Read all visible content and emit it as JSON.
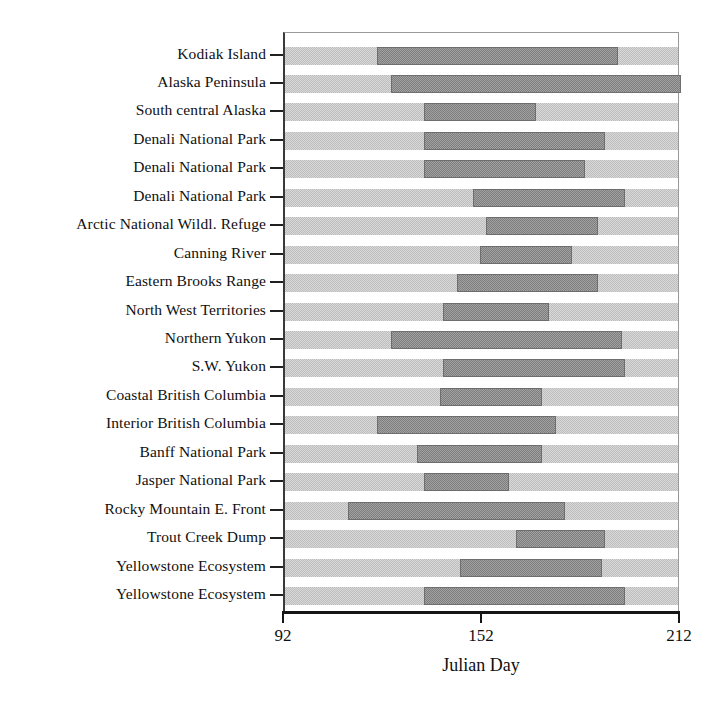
{
  "chart_data": {
    "type": "bar",
    "orientation": "horizontal",
    "subtype": "range-bar",
    "title": "",
    "xlabel": "Julian Day",
    "ylabel": "",
    "xlim": [
      92,
      212
    ],
    "xticks": [
      92,
      152,
      212
    ],
    "xticklabels": [
      "92",
      "152",
      "212"
    ],
    "grid": false,
    "legend": false,
    "band_color": "#d9d9d9",
    "bar_color": "#a2a2a2",
    "bar_edge_color": "#6e6e6e",
    "axis_color": "#151515",
    "categories": [
      "Kodiak Island",
      "Alaska Peninsula",
      "South central Alaska",
      "Denali National Park",
      "Denali National Park",
      "Denali National Park",
      "Arctic National Wildl. Refuge",
      "Canning River",
      "Eastern Brooks Range",
      "North West Territories",
      "Northern Yukon",
      "S.W. Yukon",
      "Coastal British Columbia",
      "Interior British Columbia",
      "Banff National Park",
      "Jasper National Park",
      "Rocky Mountain E. Front",
      "Trout Creek Dump",
      "Yellowstone Ecosystem",
      "Yellowstone Ecosystem"
    ],
    "ranges": [
      [
        120,
        193
      ],
      [
        124,
        212
      ],
      [
        134,
        168
      ],
      [
        134,
        189
      ],
      [
        134,
        183
      ],
      [
        149,
        195
      ],
      [
        153,
        187
      ],
      [
        151,
        179
      ],
      [
        144,
        187
      ],
      [
        140,
        172
      ],
      [
        124,
        194
      ],
      [
        140,
        195
      ],
      [
        139,
        170
      ],
      [
        120,
        174
      ],
      [
        132,
        170
      ],
      [
        134,
        160
      ],
      [
        111,
        177
      ],
      [
        162,
        189
      ],
      [
        145,
        188
      ],
      [
        134,
        195
      ]
    ],
    "range_start_label": "start Julian Day",
    "range_end_label": "end Julian Day"
  }
}
